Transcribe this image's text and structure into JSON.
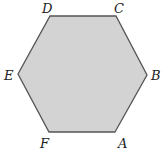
{
  "figure": {
    "shape": "regular-hexagon",
    "fill_color": "#d3d3d3",
    "stroke_color": "#555555",
    "vertices": [
      {
        "label": "A",
        "x": 115,
        "y": 132,
        "lx": 118,
        "ly": 148
      },
      {
        "label": "B",
        "x": 147,
        "y": 75,
        "lx": 151,
        "ly": 80
      },
      {
        "label": "C",
        "x": 116,
        "y": 16,
        "lx": 114,
        "ly": 13
      },
      {
        "label": "D",
        "x": 50,
        "y": 16,
        "lx": 42,
        "ly": 13
      },
      {
        "label": "E",
        "x": 18,
        "y": 74,
        "lx": 4,
        "ly": 80
      },
      {
        "label": "F",
        "x": 49,
        "y": 132,
        "lx": 40,
        "ly": 148
      }
    ]
  }
}
